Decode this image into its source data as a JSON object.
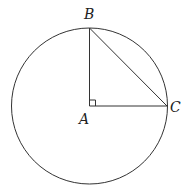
{
  "diagram": {
    "type": "geometry",
    "circle": {
      "cx": 89.5,
      "cy": 106,
      "r": 78
    },
    "points": {
      "A": {
        "label": "A",
        "x": 89.5,
        "y": 106
      },
      "B": {
        "label": "B",
        "x": 89.5,
        "y": 28
      },
      "C": {
        "label": "C",
        "x": 167,
        "y": 106
      }
    },
    "segments": [
      [
        "A",
        "B"
      ],
      [
        "A",
        "C"
      ],
      [
        "B",
        "C"
      ]
    ],
    "right_angle_at": "A",
    "stroke_color": "#333333"
  }
}
